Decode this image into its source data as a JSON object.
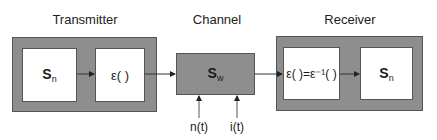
{
  "titles": {
    "transmitter": "Transmitter",
    "channel": "Channel",
    "receiver": "Receiver"
  },
  "transmitter": {
    "source": {
      "symbol": "S",
      "subscript": "n"
    },
    "encoder": {
      "label": "ε( )"
    }
  },
  "channel": {
    "symbol": "S",
    "subscript": "w",
    "inputs": [
      {
        "label": "n(t)"
      },
      {
        "label": "i(t)"
      }
    ]
  },
  "receiver": {
    "decoder": {
      "label": "ε( )=ε⁻¹( )"
    },
    "sink": {
      "symbol": "S",
      "subscript": "n"
    }
  },
  "colors": {
    "block_fill": "#8e8e8e",
    "inner_fill": "#ffffff",
    "line": "#333333"
  }
}
